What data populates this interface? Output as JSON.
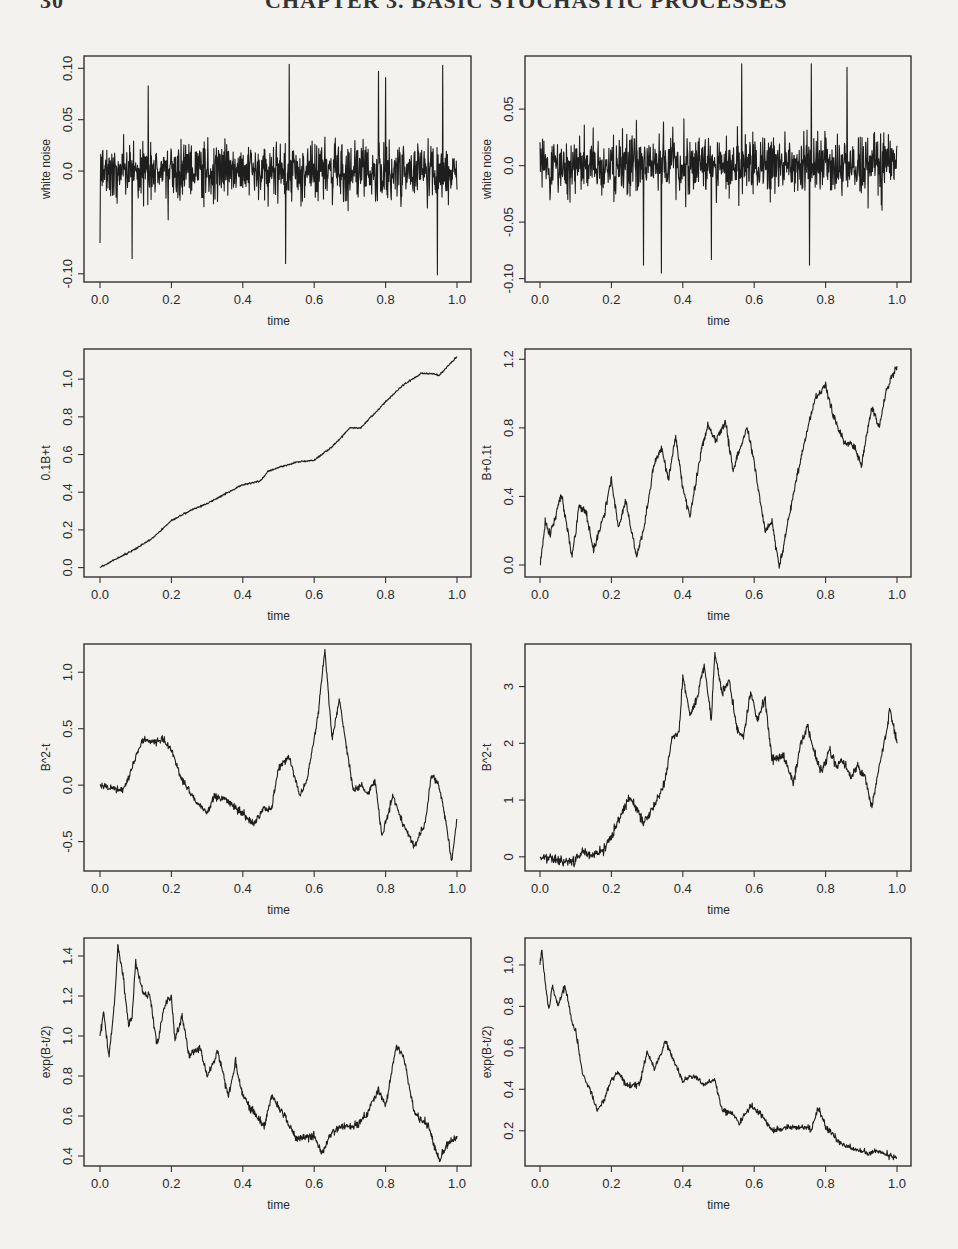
{
  "header": {
    "page_number": "30",
    "chapter_title": "CHAPTER 3. BASIC STOCHASTIC PROCESSES"
  },
  "layout": {
    "rows_y": [
      [
        56,
        282
      ],
      [
        349,
        577
      ],
      [
        644,
        871
      ],
      [
        938,
        1166
      ]
    ],
    "cols_x": [
      [
        84,
        471
      ],
      [
        525,
        911
      ]
    ],
    "x_tick_px": [
      [
        100,
        457
      ],
      [
        540,
        897
      ]
    ]
  },
  "chart_data": [
    {
      "id": "p11",
      "row": 0,
      "col": 0,
      "type": "line",
      "style": "noise",
      "xlabel": "time",
      "ylabel": "white noise",
      "xticks": [
        "0.0",
        "0.2",
        "0.4",
        "0.6",
        "0.8",
        "1.0"
      ],
      "xlim": [
        0,
        1
      ],
      "yticks": [
        {
          "v": -0.1,
          "l": "-0.10"
        },
        {
          "v": 0.0,
          "l": "0.0"
        },
        {
          "v": 0.05,
          "l": "0.05"
        },
        {
          "v": 0.1,
          "l": "0.10"
        }
      ],
      "ylim": [
        -0.108,
        0.112
      ],
      "seed": 11,
      "sd": 0.03,
      "extremes": [
        [
          0.0,
          -0.07
        ],
        [
          0.09,
          -0.085
        ],
        [
          0.135,
          0.083
        ],
        [
          0.53,
          0.104
        ],
        [
          0.52,
          -0.09
        ],
        [
          0.78,
          0.097
        ],
        [
          0.8,
          0.091
        ],
        [
          0.945,
          -0.101
        ],
        [
          0.96,
          0.103
        ]
      ]
    },
    {
      "id": "p12",
      "row": 0,
      "col": 1,
      "type": "line",
      "style": "noise",
      "xlabel": "time",
      "ylabel": "white noise",
      "xticks": [
        "0.0",
        "0.2",
        "0.4",
        "0.6",
        "0.8",
        "1.0"
      ],
      "xlim": [
        0,
        1
      ],
      "yticks": [
        {
          "v": -0.1,
          "l": "-0.10"
        },
        {
          "v": -0.05,
          "l": "-0.05"
        },
        {
          "v": 0.0,
          "l": "0.0"
        },
        {
          "v": 0.05,
          "l": "0.05"
        }
      ],
      "ylim": [
        -0.103,
        0.097
      ],
      "seed": 23,
      "sd": 0.03,
      "extremes": [
        [
          0.34,
          -0.095
        ],
        [
          0.565,
          0.09
        ],
        [
          0.76,
          0.09
        ],
        [
          0.755,
          -0.088
        ],
        [
          0.29,
          -0.088
        ],
        [
          0.48,
          -0.083
        ],
        [
          0.86,
          0.087
        ]
      ]
    },
    {
      "id": "p21",
      "row": 1,
      "col": 0,
      "type": "line",
      "style": "path",
      "xlabel": "time",
      "ylabel": "0.1B+t",
      "xticks": [
        "0.0",
        "0.2",
        "0.4",
        "0.6",
        "0.8",
        "1.0"
      ],
      "xlim": [
        0,
        1
      ],
      "yticks": [
        {
          "v": 0,
          "l": "0.0"
        },
        {
          "v": 0.2,
          "l": "0.2"
        },
        {
          "v": 0.4,
          "l": "0.4"
        },
        {
          "v": 0.6,
          "l": "0.6"
        },
        {
          "v": 0.8,
          "l": "0.8"
        },
        {
          "v": 1.0,
          "l": "1.0"
        }
      ],
      "ylim": [
        -0.05,
        1.16
      ],
      "seed": 5,
      "jitter": 0.006,
      "x": [
        0,
        0.05,
        0.1,
        0.15,
        0.2,
        0.25,
        0.3,
        0.35,
        0.4,
        0.45,
        0.47,
        0.5,
        0.55,
        0.6,
        0.65,
        0.7,
        0.73,
        0.77,
        0.8,
        0.85,
        0.9,
        0.93,
        0.95,
        1.0
      ],
      "y": [
        0,
        0.05,
        0.1,
        0.16,
        0.25,
        0.3,
        0.34,
        0.39,
        0.44,
        0.46,
        0.51,
        0.53,
        0.56,
        0.57,
        0.64,
        0.74,
        0.74,
        0.82,
        0.88,
        0.97,
        1.03,
        1.03,
        1.02,
        1.12
      ]
    },
    {
      "id": "p22",
      "row": 1,
      "col": 1,
      "type": "line",
      "style": "path",
      "xlabel": "time",
      "ylabel": "B+0.1t",
      "xticks": [
        "0.0",
        "0.2",
        "0.4",
        "0.6",
        "0.8",
        "1.0"
      ],
      "xlim": [
        0,
        1
      ],
      "yticks": [
        {
          "v": 0,
          "l": "0.0"
        },
        {
          "v": 0.4,
          "l": "0.4"
        },
        {
          "v": 0.8,
          "l": "0.8"
        },
        {
          "v": 1.2,
          "l": "1.2"
        }
      ],
      "ylim": [
        -0.07,
        1.26
      ],
      "seed": 7,
      "jitter": 0.03,
      "x": [
        0,
        0.015,
        0.03,
        0.06,
        0.09,
        0.11,
        0.13,
        0.15,
        0.18,
        0.2,
        0.22,
        0.24,
        0.27,
        0.29,
        0.32,
        0.34,
        0.36,
        0.38,
        0.4,
        0.42,
        0.45,
        0.47,
        0.49,
        0.52,
        0.54,
        0.56,
        0.58,
        0.6,
        0.63,
        0.65,
        0.67,
        0.69,
        0.72,
        0.75,
        0.77,
        0.8,
        0.82,
        0.85,
        0.88,
        0.9,
        0.93,
        0.95,
        0.97,
        1.0
      ],
      "y": [
        0,
        0.25,
        0.18,
        0.42,
        0.05,
        0.35,
        0.3,
        0.08,
        0.3,
        0.5,
        0.22,
        0.38,
        0.05,
        0.2,
        0.6,
        0.68,
        0.5,
        0.75,
        0.45,
        0.28,
        0.65,
        0.82,
        0.72,
        0.84,
        0.55,
        0.68,
        0.8,
        0.6,
        0.2,
        0.25,
        -0.01,
        0.2,
        0.52,
        0.8,
        0.97,
        1.05,
        0.88,
        0.72,
        0.7,
        0.58,
        0.93,
        0.8,
        1.02,
        1.16
      ]
    },
    {
      "id": "p31",
      "row": 2,
      "col": 0,
      "type": "line",
      "style": "path",
      "xlabel": "time",
      "ylabel": "B^2-t",
      "xticks": [
        "0.0",
        "0.2",
        "0.4",
        "0.6",
        "0.8",
        "1.0"
      ],
      "xlim": [
        0,
        1
      ],
      "yticks": [
        {
          "v": -0.5,
          "l": "-0.5"
        },
        {
          "v": 0,
          "l": "0.0"
        },
        {
          "v": 0.5,
          "l": "0.5"
        },
        {
          "v": 1.0,
          "l": "1.0"
        }
      ],
      "ylim": [
        -0.76,
        1.25
      ],
      "seed": 13,
      "jitter": 0.04,
      "x": [
        0,
        0.03,
        0.06,
        0.08,
        0.1,
        0.12,
        0.15,
        0.18,
        0.2,
        0.23,
        0.27,
        0.3,
        0.32,
        0.35,
        0.38,
        0.41,
        0.43,
        0.46,
        0.48,
        0.5,
        0.53,
        0.56,
        0.58,
        0.61,
        0.63,
        0.65,
        0.67,
        0.69,
        0.71,
        0.73,
        0.75,
        0.77,
        0.79,
        0.82,
        0.85,
        0.88,
        0.91,
        0.93,
        0.95,
        0.97,
        0.985,
        1.0
      ],
      "y": [
        0,
        -0.02,
        -0.05,
        0.05,
        0.25,
        0.4,
        0.38,
        0.4,
        0.3,
        0.05,
        -0.15,
        -0.25,
        -0.1,
        -0.12,
        -0.2,
        -0.28,
        -0.35,
        -0.2,
        -0.22,
        0.15,
        0.25,
        -0.1,
        0.05,
        0.6,
        1.2,
        0.4,
        0.75,
        0.35,
        -0.05,
        0.0,
        -0.08,
        0.05,
        -0.45,
        -0.1,
        -0.35,
        -0.55,
        -0.35,
        0.1,
        0.0,
        -0.35,
        -0.68,
        -0.3
      ]
    },
    {
      "id": "p32",
      "row": 2,
      "col": 1,
      "type": "line",
      "style": "path",
      "xlabel": "time",
      "ylabel": "B^2-t",
      "xticks": [
        "0.0",
        "0.2",
        "0.4",
        "0.6",
        "0.8",
        "1.0"
      ],
      "xlim": [
        0,
        1
      ],
      "yticks": [
        {
          "v": 0,
          "l": "0"
        },
        {
          "v": 1,
          "l": "1"
        },
        {
          "v": 2,
          "l": "2"
        },
        {
          "v": 3,
          "l": "3"
        }
      ],
      "ylim": [
        -0.25,
        3.75
      ],
      "seed": 17,
      "jitter": 0.1,
      "x": [
        0,
        0.03,
        0.06,
        0.09,
        0.12,
        0.15,
        0.18,
        0.2,
        0.23,
        0.25,
        0.27,
        0.29,
        0.32,
        0.35,
        0.37,
        0.39,
        0.4,
        0.42,
        0.44,
        0.46,
        0.48,
        0.49,
        0.51,
        0.53,
        0.55,
        0.57,
        0.59,
        0.61,
        0.63,
        0.65,
        0.68,
        0.71,
        0.73,
        0.75,
        0.77,
        0.79,
        0.81,
        0.83,
        0.85,
        0.87,
        0.89,
        0.91,
        0.93,
        0.95,
        0.97,
        0.98,
        1.0
      ],
      "y": [
        0,
        -0.02,
        -0.06,
        -0.1,
        0.1,
        0.0,
        0.15,
        0.35,
        0.8,
        1.05,
        0.85,
        0.6,
        0.9,
        1.3,
        2.1,
        2.2,
        3.2,
        2.5,
        2.8,
        3.4,
        2.4,
        3.6,
        2.9,
        3.1,
        2.3,
        2.1,
        2.9,
        2.4,
        2.8,
        1.7,
        1.8,
        1.3,
        2.0,
        2.3,
        1.8,
        1.5,
        1.9,
        1.6,
        1.7,
        1.4,
        1.6,
        1.4,
        0.9,
        1.6,
        2.2,
        2.6,
        2.0
      ]
    },
    {
      "id": "p41",
      "row": 3,
      "col": 0,
      "type": "line",
      "style": "path",
      "xlabel": "time",
      "ylabel": "exp(B-t/2)",
      "xticks": [
        "0.0",
        "0.2",
        "0.4",
        "0.6",
        "0.8",
        "1.0"
      ],
      "xlim": [
        0,
        1
      ],
      "yticks": [
        {
          "v": 0.4,
          "l": "0.4"
        },
        {
          "v": 0.6,
          "l": "0.6"
        },
        {
          "v": 0.8,
          "l": "0.8"
        },
        {
          "v": 1.0,
          "l": "1.0"
        },
        {
          "v": 1.2,
          "l": "1.2"
        },
        {
          "v": 1.4,
          "l": "1.4"
        }
      ],
      "ylim": [
        0.35,
        1.49
      ],
      "seed": 19,
      "jitter": 0.025,
      "x": [
        0,
        0.01,
        0.025,
        0.04,
        0.05,
        0.065,
        0.08,
        0.09,
        0.1,
        0.12,
        0.14,
        0.16,
        0.18,
        0.2,
        0.21,
        0.23,
        0.25,
        0.28,
        0.3,
        0.33,
        0.36,
        0.38,
        0.4,
        0.43,
        0.46,
        0.48,
        0.51,
        0.55,
        0.58,
        0.6,
        0.62,
        0.65,
        0.68,
        0.72,
        0.75,
        0.78,
        0.8,
        0.83,
        0.85,
        0.88,
        0.9,
        0.92,
        0.95,
        0.97,
        1.0
      ],
      "y": [
        1.0,
        1.12,
        0.9,
        1.15,
        1.45,
        1.3,
        1.05,
        1.1,
        1.37,
        1.22,
        1.2,
        0.95,
        1.15,
        1.2,
        0.98,
        1.1,
        0.9,
        0.95,
        0.8,
        0.92,
        0.7,
        0.87,
        0.7,
        0.62,
        0.55,
        0.7,
        0.62,
        0.48,
        0.5,
        0.5,
        0.41,
        0.52,
        0.55,
        0.55,
        0.62,
        0.73,
        0.65,
        0.95,
        0.9,
        0.62,
        0.58,
        0.55,
        0.38,
        0.45,
        0.5
      ]
    },
    {
      "id": "p42",
      "row": 3,
      "col": 1,
      "type": "line",
      "style": "path",
      "xlabel": "time",
      "ylabel": "exp(B-t/2)",
      "xticks": [
        "0.0",
        "0.2",
        "0.4",
        "0.6",
        "0.8",
        "1.0"
      ],
      "xlim": [
        0,
        1
      ],
      "yticks": [
        {
          "v": 0.2,
          "l": "0.2"
        },
        {
          "v": 0.4,
          "l": "0.4"
        },
        {
          "v": 0.6,
          "l": "0.6"
        },
        {
          "v": 0.8,
          "l": "0.8"
        },
        {
          "v": 1.0,
          "l": "1.0"
        }
      ],
      "ylim": [
        0.03,
        1.13
      ],
      "seed": 29,
      "jitter": 0.018,
      "x": [
        0,
        0.005,
        0.015,
        0.025,
        0.035,
        0.05,
        0.07,
        0.09,
        0.1,
        0.12,
        0.14,
        0.16,
        0.18,
        0.2,
        0.22,
        0.24,
        0.26,
        0.28,
        0.3,
        0.32,
        0.34,
        0.35,
        0.38,
        0.4,
        0.43,
        0.46,
        0.49,
        0.51,
        0.54,
        0.56,
        0.59,
        0.62,
        0.65,
        0.68,
        0.72,
        0.76,
        0.78,
        0.8,
        0.84,
        0.88,
        0.92,
        0.95,
        0.98,
        1.0
      ],
      "y": [
        1.0,
        1.08,
        0.9,
        0.78,
        0.9,
        0.8,
        0.9,
        0.72,
        0.68,
        0.47,
        0.4,
        0.3,
        0.35,
        0.45,
        0.48,
        0.42,
        0.42,
        0.43,
        0.58,
        0.5,
        0.57,
        0.64,
        0.52,
        0.44,
        0.47,
        0.42,
        0.45,
        0.3,
        0.28,
        0.24,
        0.32,
        0.28,
        0.2,
        0.21,
        0.22,
        0.21,
        0.31,
        0.22,
        0.14,
        0.11,
        0.09,
        0.1,
        0.08,
        0.07
      ]
    }
  ]
}
